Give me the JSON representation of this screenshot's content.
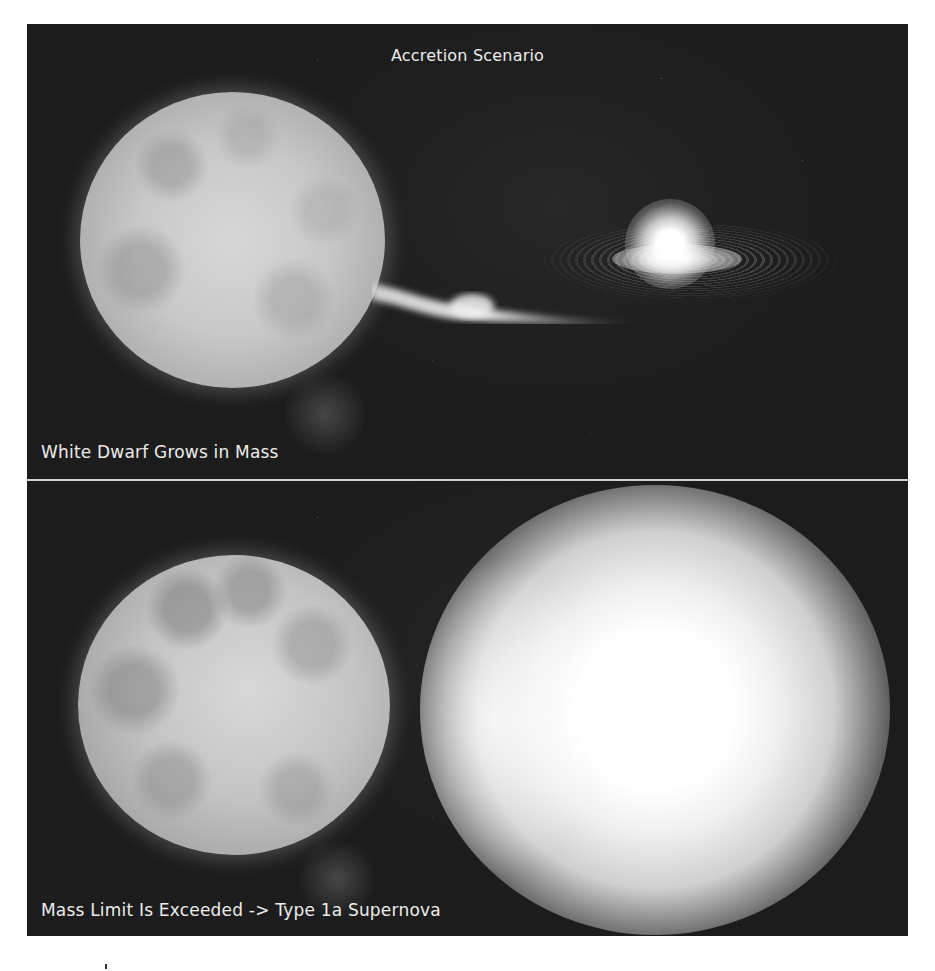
{
  "figure": {
    "title": "Accretion Scenario",
    "panels": [
      {
        "id": "top",
        "caption": "White Dwarf Grows in Mass",
        "elements": [
          "red-giant-star",
          "mass-transfer-stream",
          "accretion-disk",
          "white-dwarf"
        ]
      },
      {
        "id": "bottom",
        "caption": "Mass Limit Is Exceeded -> Type 1a Supernova",
        "elements": [
          "red-giant-star",
          "supernova-explosion"
        ]
      }
    ],
    "colors": {
      "background": "#1c1c1c",
      "text": "#ececec",
      "divider": "#cfcfcf",
      "page": "#ffffff"
    }
  }
}
